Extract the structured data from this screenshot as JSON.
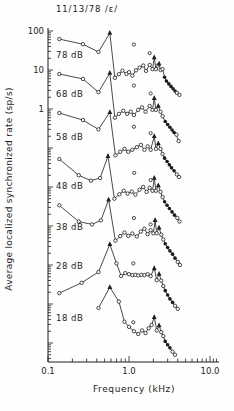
{
  "chart_data": {
    "type": "line",
    "title": "11/13/78 /ε/",
    "xlabel": "Frequency (kHz)",
    "ylabel": "Average localized synchronized rate (sp/s)",
    "x_scale": "log",
    "y_scale": "log",
    "xlim": [
      0.1,
      13
    ],
    "ylim_displayed": [
      3.2e-07,
      100
    ],
    "grid": false,
    "ink_color": "#1c1c1c",
    "background_color": "#fefefe",
    "offset_note": "each successive curve is shifted down one decade",
    "x_tick_labels": [
      {
        "value": 0.1,
        "label": "0.1"
      },
      {
        "value": 1.0,
        "label": "1.0"
      },
      {
        "value": 10.0,
        "label": "10.0"
      }
    ],
    "y_tick_labels": [
      {
        "value": 100,
        "label": "100"
      },
      {
        "value": 10,
        "label": "10"
      },
      {
        "value": 1,
        "label": "1"
      }
    ],
    "marker_legend": {
      "o": "open-circle",
      "t": "filled-triangle-formant-peak",
      "f": "filled-circle"
    },
    "series": [
      {
        "label": "78 dB",
        "offset_decades": 0,
        "label_pos": [
          56,
          55
        ],
        "points": [
          [
            0.138,
            62,
            "o"
          ],
          [
            0.27,
            46,
            "o"
          ],
          [
            0.42,
            29,
            "o"
          ],
          [
            0.58,
            89,
            "t"
          ],
          [
            0.67,
            6.3,
            "o"
          ],
          [
            0.75,
            7.8,
            "o"
          ],
          [
            0.83,
            9.6,
            "o"
          ],
          [
            0.93,
            7.9,
            "o"
          ],
          [
            1.0,
            8.8,
            "o"
          ],
          [
            1.1,
            7.2,
            "o"
          ],
          [
            1.22,
            9.8,
            "o"
          ],
          [
            1.35,
            11.5,
            "o"
          ],
          [
            1.5,
            13.0,
            "o"
          ],
          [
            1.62,
            9.5,
            "o"
          ],
          [
            1.8,
            13.5,
            "o"
          ],
          [
            1.95,
            10.5,
            "o"
          ],
          [
            2.05,
            21,
            "t"
          ],
          [
            2.15,
            10.5,
            "o"
          ],
          [
            2.25,
            13,
            "o"
          ],
          [
            2.35,
            14.5,
            "t"
          ],
          [
            2.45,
            10,
            "o"
          ],
          [
            2.6,
            10.5,
            "o"
          ],
          [
            2.75,
            6.5,
            "f"
          ],
          [
            2.9,
            5.2,
            "f"
          ],
          [
            3.1,
            4.4,
            "f"
          ],
          [
            3.3,
            3.8,
            "f"
          ],
          [
            3.5,
            3.3,
            "f"
          ],
          [
            3.7,
            2.9,
            "f"
          ],
          [
            3.9,
            2.6,
            "o"
          ],
          [
            4.2,
            2.3,
            "o"
          ]
        ],
        "extra_points": [
          [
            1.15,
            45
          ],
          [
            1.8,
            27
          ]
        ]
      },
      {
        "label": "68 dB",
        "offset_decades": 1,
        "label_pos": [
          56,
          94
        ],
        "points": [
          [
            0.138,
            79,
            "o"
          ],
          [
            0.27,
            59,
            "o"
          ],
          [
            0.42,
            27,
            "o"
          ],
          [
            0.58,
            84,
            "t"
          ],
          [
            0.67,
            6.0,
            "o"
          ],
          [
            0.75,
            7.5,
            "o"
          ],
          [
            0.85,
            9.0,
            "o"
          ],
          [
            0.95,
            7.5,
            "o"
          ],
          [
            1.05,
            8.5,
            "o"
          ],
          [
            1.15,
            7.0,
            "o"
          ],
          [
            1.3,
            9.5,
            "o"
          ],
          [
            1.45,
            11,
            "o"
          ],
          [
            1.6,
            8.5,
            "o"
          ],
          [
            1.8,
            12,
            "o"
          ],
          [
            1.95,
            9.5,
            "o"
          ],
          [
            2.05,
            19,
            "t"
          ],
          [
            2.15,
            9.5,
            "o"
          ],
          [
            2.3,
            12,
            "t"
          ],
          [
            2.45,
            8.5,
            "o"
          ],
          [
            2.6,
            6.5,
            "o"
          ],
          [
            2.8,
            4.8,
            "f"
          ],
          [
            3.0,
            4.0,
            "f"
          ],
          [
            3.2,
            3.4,
            "f"
          ],
          [
            3.4,
            2.9,
            "f"
          ],
          [
            3.6,
            2.5,
            "f"
          ],
          [
            3.85,
            2.2,
            "o"
          ],
          [
            4.1,
            1.5,
            "o"
          ]
        ],
        "extra_points": [
          [
            1.15,
            40
          ],
          [
            1.85,
            25
          ]
        ]
      },
      {
        "label": "58 dB",
        "offset_decades": 2,
        "label_pos": [
          56,
          137
        ],
        "points": [
          [
            0.138,
            79,
            "o"
          ],
          [
            0.27,
            52,
            "o"
          ],
          [
            0.42,
            30,
            "o"
          ],
          [
            0.58,
            83,
            "t"
          ],
          [
            0.68,
            6.5,
            "o"
          ],
          [
            0.78,
            8,
            "o"
          ],
          [
            0.88,
            9.5,
            "o"
          ],
          [
            0.98,
            8,
            "o"
          ],
          [
            1.1,
            9,
            "o"
          ],
          [
            1.25,
            10.5,
            "o"
          ],
          [
            1.4,
            12,
            "o"
          ],
          [
            1.55,
            9,
            "o"
          ],
          [
            1.7,
            11,
            "o"
          ],
          [
            1.85,
            9,
            "o"
          ],
          [
            2.05,
            20,
            "t"
          ],
          [
            2.15,
            9.5,
            "o"
          ],
          [
            2.3,
            13,
            "t"
          ],
          [
            2.45,
            9.5,
            "o"
          ],
          [
            2.6,
            7,
            "o"
          ],
          [
            2.75,
            5.5,
            "f"
          ],
          [
            2.95,
            4.5,
            "f"
          ],
          [
            3.15,
            3.7,
            "f"
          ],
          [
            3.35,
            3.1,
            "f"
          ],
          [
            3.6,
            2.6,
            "f"
          ],
          [
            3.9,
            2.1,
            "o"
          ],
          [
            4.15,
            1.8,
            "o"
          ]
        ],
        "extra_points": [
          [
            1.15,
            35
          ],
          [
            1.85,
            24
          ]
        ]
      },
      {
        "label": "48 dB",
        "offset_decades": 3,
        "label_pos": [
          56,
          186
        ],
        "points": [
          [
            0.138,
            52,
            "o"
          ],
          [
            0.24,
            20,
            "o"
          ],
          [
            0.34,
            14.5,
            "o"
          ],
          [
            0.44,
            17,
            "o"
          ],
          [
            0.55,
            62,
            "t"
          ],
          [
            0.66,
            5.0,
            "o"
          ],
          [
            0.76,
            6.5,
            "o"
          ],
          [
            0.86,
            8,
            "o"
          ],
          [
            0.96,
            6.8,
            "o"
          ],
          [
            1.08,
            7.6,
            "o"
          ],
          [
            1.2,
            6.4,
            "o"
          ],
          [
            1.35,
            8.5,
            "o"
          ],
          [
            1.5,
            10,
            "o"
          ],
          [
            1.65,
            7.5,
            "o"
          ],
          [
            1.8,
            9.5,
            "o"
          ],
          [
            1.95,
            8,
            "o"
          ],
          [
            2.05,
            17,
            "t"
          ],
          [
            2.15,
            8,
            "o"
          ],
          [
            2.3,
            11,
            "t"
          ],
          [
            2.45,
            7.5,
            "o"
          ],
          [
            2.6,
            5.5,
            "o"
          ],
          [
            2.75,
            4.2,
            "f"
          ],
          [
            2.95,
            3.4,
            "f"
          ],
          [
            3.15,
            2.8,
            "f"
          ],
          [
            3.4,
            2.3,
            "f"
          ],
          [
            3.65,
            1.9,
            "f"
          ],
          [
            3.95,
            1.6,
            "o"
          ],
          [
            4.2,
            1.3,
            "o"
          ]
        ],
        "extra_points": [
          [
            1.16,
            23
          ],
          [
            1.85,
            15
          ]
        ]
      },
      {
        "label": "38 dB",
        "offset_decades": 4,
        "label_pos": [
          56,
          227
        ],
        "points": [
          [
            0.138,
            34,
            "o"
          ],
          [
            0.24,
            13,
            "o"
          ],
          [
            0.35,
            11,
            "o"
          ],
          [
            0.45,
            14,
            "o"
          ],
          [
            0.56,
            47,
            "t"
          ],
          [
            0.68,
            4.2,
            "o"
          ],
          [
            0.78,
            5.5,
            "o"
          ],
          [
            0.88,
            6.8,
            "o"
          ],
          [
            0.98,
            5.6,
            "o"
          ],
          [
            1.1,
            6.4,
            "o"
          ],
          [
            1.25,
            5.4,
            "o"
          ],
          [
            1.4,
            7.2,
            "o"
          ],
          [
            1.55,
            8.5,
            "o"
          ],
          [
            1.7,
            6.2,
            "o"
          ],
          [
            1.85,
            7.8,
            "o"
          ],
          [
            2.0,
            6.5,
            "o"
          ],
          [
            2.1,
            14,
            "t"
          ],
          [
            2.2,
            6.5,
            "o"
          ],
          [
            2.35,
            9,
            "t"
          ],
          [
            2.5,
            6,
            "o"
          ],
          [
            2.65,
            4.5,
            "o"
          ],
          [
            2.8,
            3.5,
            "f"
          ],
          [
            3.0,
            2.8,
            "f"
          ],
          [
            3.2,
            2.3,
            "f"
          ],
          [
            3.45,
            1.9,
            "f"
          ],
          [
            3.7,
            1.5,
            "f"
          ],
          [
            4.0,
            1.2,
            "o"
          ],
          [
            4.25,
            1.0,
            "o"
          ]
        ],
        "extra_points": [
          [
            1.15,
            16
          ],
          [
            1.85,
            11
          ]
        ]
      },
      {
        "label": "28 dB",
        "offset_decades": 5,
        "label_pos": [
          56,
          266
        ],
        "points": [
          [
            0.138,
            1.9,
            "o"
          ],
          [
            0.26,
            3.5,
            "o"
          ],
          [
            0.42,
            6.6,
            "o"
          ],
          [
            0.58,
            34,
            "t"
          ],
          [
            0.7,
            11,
            "o"
          ],
          [
            0.8,
            5.2,
            "o"
          ],
          [
            0.9,
            6.2,
            "o"
          ],
          [
            1.0,
            5.8,
            "o"
          ],
          [
            1.1,
            5.5,
            "o"
          ],
          [
            1.2,
            5.6,
            "o"
          ],
          [
            1.3,
            5.4,
            "o"
          ],
          [
            1.42,
            5.6,
            "o"
          ],
          [
            1.55,
            5.5,
            "o"
          ],
          [
            1.7,
            5.8,
            "o"
          ],
          [
            1.85,
            5.2,
            "o"
          ],
          [
            2.05,
            8.2,
            "t"
          ],
          [
            2.2,
            4.1,
            "o"
          ],
          [
            2.35,
            5.9,
            "t"
          ],
          [
            2.5,
            4.0,
            "o"
          ],
          [
            2.65,
            2.9,
            "o"
          ],
          [
            2.8,
            2.2,
            "f"
          ],
          [
            3.0,
            1.7,
            "f"
          ],
          [
            3.2,
            1.35,
            "f"
          ],
          [
            3.45,
            1.1,
            "f"
          ],
          [
            3.7,
            0.9,
            "o"
          ],
          [
            4.0,
            0.75,
            "o"
          ]
        ],
        "extra_points": [
          [
            1.13,
            11
          ]
        ]
      },
      {
        "label": "18 dB",
        "offset_decades": 6,
        "label_pos": [
          56,
          318
        ],
        "points": [
          [
            0.42,
            7.9,
            "o"
          ],
          [
            0.58,
            27,
            "t"
          ],
          [
            0.75,
            11.5,
            "o"
          ],
          [
            0.88,
            3.5,
            "o"
          ],
          [
            1.0,
            2.6,
            "o"
          ],
          [
            1.15,
            2.0,
            "o"
          ],
          [
            1.3,
            1.7,
            "o"
          ],
          [
            1.45,
            2.1,
            "o"
          ],
          [
            1.6,
            1.8,
            "o"
          ],
          [
            1.75,
            2.4,
            "o"
          ],
          [
            1.9,
            2.9,
            "o"
          ],
          [
            2.05,
            4.6,
            "t"
          ],
          [
            2.2,
            2.1,
            "o"
          ],
          [
            2.35,
            2.8,
            "t"
          ],
          [
            2.5,
            1.9,
            "o"
          ],
          [
            2.65,
            1.5,
            "o"
          ],
          [
            2.8,
            1.1,
            "f"
          ],
          [
            3.0,
            0.9,
            "f"
          ],
          [
            3.2,
            0.75,
            "f"
          ],
          [
            3.45,
            0.6,
            "o"
          ],
          [
            3.7,
            0.5,
            "o"
          ]
        ],
        "extra_points": [
          [
            1.13,
            3.4
          ]
        ]
      }
    ]
  }
}
